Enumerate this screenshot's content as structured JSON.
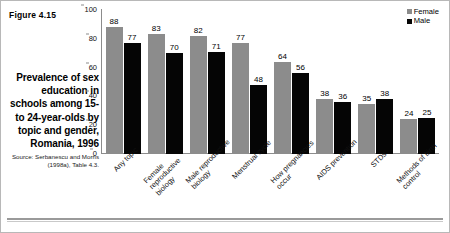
{
  "figure": {
    "number": "Figure 4.15",
    "caption": "Prevalence of sex education in schools among 15- to 24-year-olds by topic and gender, Romania, 1996",
    "source": "Source: Serbanescu and Morris (1998a), Table 4.3."
  },
  "legend": {
    "female_label": "Female",
    "male_label": "Male"
  },
  "colors": {
    "female": "#8c8c8c",
    "male": "#050505",
    "axis": "#8c8c8c",
    "background": "#ffffff"
  },
  "chart_data": {
    "type": "bar",
    "title": "Prevalence of sex education in schools among 15- to 24-year-olds by topic and gender, Romania, 1996",
    "xlabel": "",
    "ylabel": "",
    "ylim": [
      0,
      100
    ],
    "yticks": [
      0,
      20,
      40,
      60,
      80,
      100
    ],
    "ytick_labels": [
      "0",
      "20",
      "40",
      "60",
      "80",
      "100"
    ],
    "grid": false,
    "legend_position": "top-right",
    "categories": [
      "Any topic",
      "Female reproductive biology",
      "Male reproductive biology",
      "Menstrual cycle",
      "How pregnancies occur",
      "AIDS prevention",
      "STDs",
      "Methods of birth control"
    ],
    "series": [
      {
        "name": "Female",
        "values": [
          88,
          83,
          82,
          77,
          64,
          38,
          35,
          24
        ]
      },
      {
        "name": "Male",
        "values": [
          77,
          70,
          71,
          48,
          56,
          36,
          38,
          25
        ]
      }
    ]
  }
}
